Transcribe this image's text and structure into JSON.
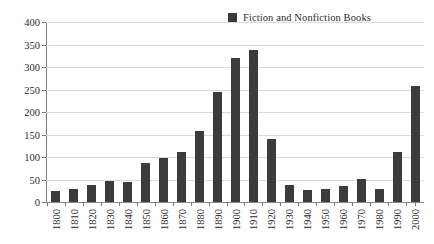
{
  "chart_data": {
    "type": "bar",
    "title": "",
    "subtitle": "",
    "xlabel": "",
    "ylabel": "",
    "ylim": [
      0,
      400
    ],
    "yticks": [
      0,
      50,
      100,
      150,
      200,
      250,
      300,
      350,
      400
    ],
    "grid": true,
    "legend_position": "top-right",
    "legend": [
      "Fiction and Nonfiction Books"
    ],
    "series": [
      {
        "name": "Fiction and Nonfiction Books",
        "color": "#3c3c3c",
        "values": [
          24,
          30,
          38,
          46,
          45,
          87,
          97,
          112,
          158,
          245,
          320,
          338,
          140,
          38,
          27,
          28,
          36,
          52,
          30,
          112,
          257
        ]
      }
    ],
    "categories": [
      "1800",
      "1810",
      "1820",
      "1830",
      "1840",
      "1850",
      "1860",
      "1870",
      "1880",
      "1890",
      "1900",
      "1910",
      "1920",
      "1930",
      "1940",
      "1950",
      "1960",
      "1970",
      "1980",
      "1990",
      "2000"
    ]
  },
  "colors": {
    "bar": "#3c3c3c",
    "gridline": "#d8d8d8",
    "axis": "#7a7a7a",
    "text": "#2b2b2b",
    "background": "#ffffff"
  }
}
